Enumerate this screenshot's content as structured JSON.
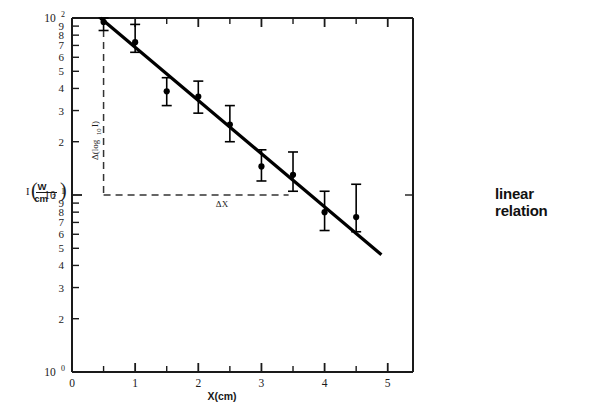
{
  "figure": {
    "background_color": "#ffffff",
    "axis_color": "#1a1a1a",
    "data_color": "#000000",
    "dashed_color": "#333333"
  },
  "side_note": {
    "line1": "linear",
    "line2": "relation"
  },
  "annotations": {
    "delta_log_prefix": "Δ(log",
    "delta_log_sub": "10",
    "delta_log_suffix": "I)",
    "delta_x": "ΔX"
  },
  "chart_data": {
    "type": "scatter",
    "title": "",
    "xlabel": "X(cm)",
    "ylabel_prefix": "I",
    "ylabel_numerator": "W",
    "ylabel_denominator": "cm",
    "ylabel_denominator_exp": "2",
    "xlim": [
      0,
      5.4
    ],
    "ylim": [
      1,
      100
    ],
    "yscale": "log",
    "xscale": "linear",
    "grid": false,
    "legend": false,
    "x_ticks_major": [
      0,
      1,
      2,
      3,
      4,
      5
    ],
    "x_ticks_minor": [
      0.5,
      1.5,
      2.5,
      3.5,
      4.5
    ],
    "y_ticks_labeled": [
      {
        "value": 100,
        "label_base": "10",
        "label_exp": "2"
      },
      {
        "value": 90,
        "label": "9"
      },
      {
        "value": 80,
        "label": "8"
      },
      {
        "value": 70,
        "label": "7"
      },
      {
        "value": 60,
        "label": "6"
      },
      {
        "value": 50,
        "label": "5"
      },
      {
        "value": 40,
        "label": "4"
      },
      {
        "value": 30,
        "label": "3"
      },
      {
        "value": 20,
        "label": "2"
      },
      {
        "value": 10,
        "label_base": "10",
        "label_exp": "1"
      },
      {
        "value": 9,
        "label": "9"
      },
      {
        "value": 8,
        "label": "8"
      },
      {
        "value": 7,
        "label": "7"
      },
      {
        "value": 6,
        "label": "6"
      },
      {
        "value": 5,
        "label": "5"
      },
      {
        "value": 4,
        "label": "4"
      },
      {
        "value": 3,
        "label": "3"
      },
      {
        "value": 2,
        "label": "2"
      },
      {
        "value": 1,
        "label_base": "10",
        "label_exp": "0"
      }
    ],
    "points": [
      {
        "x": 0.5,
        "y": 95.0,
        "yerr_low": 85.0,
        "yerr_high": 100.0
      },
      {
        "x": 1.0,
        "y": 73.0,
        "yerr_low": 64.0,
        "yerr_high": 92.0
      },
      {
        "x": 1.5,
        "y": 38.5,
        "yerr_low": 32.0,
        "yerr_high": 46.0
      },
      {
        "x": 2.0,
        "y": 36.0,
        "yerr_low": 29.0,
        "yerr_high": 44.0
      },
      {
        "x": 2.5,
        "y": 25.0,
        "yerr_low": 20.0,
        "yerr_high": 32.0
      },
      {
        "x": 3.0,
        "y": 14.5,
        "yerr_low": 12.0,
        "yerr_high": 18.0
      },
      {
        "x": 3.5,
        "y": 13.0,
        "yerr_low": 10.5,
        "yerr_high": 17.5
      },
      {
        "x": 4.0,
        "y": 8.0,
        "yerr_low": 6.3,
        "yerr_high": 10.5
      },
      {
        "x": 4.5,
        "y": 7.5,
        "yerr_low": 6.2,
        "yerr_high": 11.5
      }
    ],
    "fit_line": {
      "x_start": 0.45,
      "y_start": 100.0,
      "x_end": 4.9,
      "y_end": 4.6
    },
    "construction": {
      "vertical_dashed_x": 0.5,
      "vertical_dashed_y_top": 100.0,
      "vertical_dashed_y_bottom": 10.0,
      "horizontal_dashed_y": 10.0,
      "horizontal_dashed_x_start": 0.5,
      "horizontal_dashed_x_end": 3.43
    }
  }
}
